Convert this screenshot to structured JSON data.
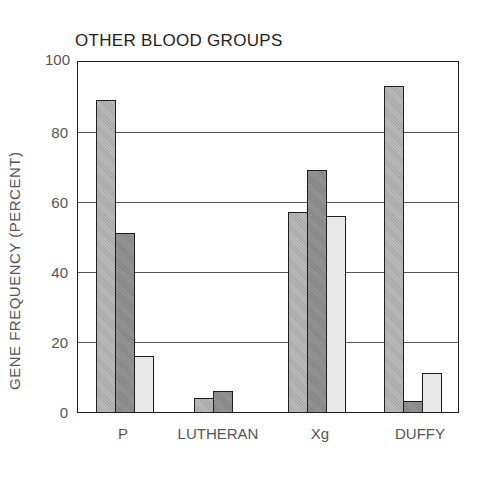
{
  "chart_data": {
    "type": "bar",
    "title": "OTHER BLOOD GROUPS",
    "xlabel": "",
    "ylabel": "GENE FREQUENCY (PERCENT)",
    "ylim": [
      0,
      100
    ],
    "yticks": [
      "0",
      "20",
      "40",
      "60",
      "80",
      "100"
    ],
    "grid": true,
    "legend": null,
    "categories": [
      "P",
      "LUTHERAN",
      "Xg",
      "DUFFY"
    ],
    "series": [
      {
        "name": "Series 1 (medium gray)",
        "color": "#b0b0b0",
        "values": [
          89,
          4,
          57,
          93
        ]
      },
      {
        "name": "Series 2 (dark gray)",
        "color": "#8c8c8c",
        "values": [
          51,
          6,
          69,
          3
        ]
      },
      {
        "name": "Series 3 (light gray)",
        "color": "#e6e6e6",
        "values": [
          16,
          null,
          56,
          11
        ]
      }
    ]
  },
  "labels": {
    "title": "OTHER BLOOD GROUPS",
    "ylabel": "GENE FREQUENCY (PERCENT)",
    "yticks": [
      "0",
      "20",
      "40",
      "60",
      "80",
      "100"
    ],
    "categories": [
      "P",
      "LUTHERAN",
      "Xg",
      "DUFFY"
    ]
  }
}
